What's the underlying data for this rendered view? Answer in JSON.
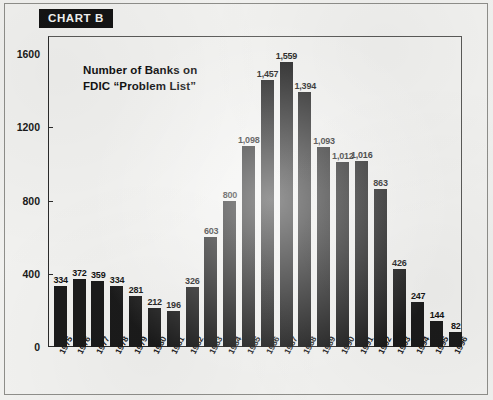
{
  "badge": {
    "label": "CHART B"
  },
  "chart_data": {
    "type": "bar",
    "title": "Number of Banks on FDIC “Problem List”",
    "title_line1": "Number of Banks on",
    "title_line2": "FDIC “Problem List”",
    "xlabel": "",
    "ylabel": "",
    "ylim": [
      0,
      1700
    ],
    "yticks": [
      0,
      400,
      800,
      1200,
      1600
    ],
    "ytick_labels": [
      "0",
      "400",
      "800",
      "1200",
      "1600"
    ],
    "grid": false,
    "legend": null,
    "bar_color": "#1b1b1b",
    "categories": [
      "1975",
      "1976",
      "1977",
      "1978",
      "1979",
      "1980",
      "1981",
      "1982",
      "1983",
      "1984",
      "1985",
      "1986",
      "1987",
      "1988",
      "1989",
      "1990",
      "1991",
      "1992",
      "1993",
      "1994",
      "1995",
      "1996"
    ],
    "values": [
      334,
      372,
      359,
      334,
      281,
      212,
      196,
      326,
      603,
      800,
      1098,
      1457,
      1559,
      1394,
      1093,
      1012,
      1016,
      863,
      426,
      247,
      144,
      82
    ],
    "value_labels": [
      "334",
      "372",
      "359",
      "334",
      "281",
      "212",
      "196",
      "326",
      "603",
      "800",
      "1,098",
      "1,457",
      "1,559",
      "1,394",
      "1,093",
      "1,012",
      "1,016",
      "863",
      "426",
      "247",
      "144",
      "82"
    ]
  }
}
